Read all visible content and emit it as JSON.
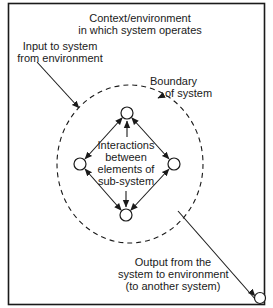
{
  "diagram": {
    "type": "system-context-diagram",
    "labels": {
      "context_line1": "Context/environment",
      "context_line2": "in which system operates",
      "input_line1": "Input to system",
      "input_line2": "from environment",
      "boundary_line1": "Boundary",
      "boundary_line2": "of system",
      "interactions_line1": "Interactions",
      "interactions_line2": "between",
      "interactions_line3": "elements of",
      "interactions_line4": "sub-system",
      "output_line1": "Output from the",
      "output_line2": "system to environment",
      "output_line3": "(to another system)"
    },
    "nodes": [
      {
        "id": "top",
        "role": "sub-system element"
      },
      {
        "id": "left",
        "role": "sub-system element"
      },
      {
        "id": "right",
        "role": "sub-system element"
      },
      {
        "id": "bottom",
        "role": "sub-system element"
      },
      {
        "id": "external",
        "role": "another system"
      }
    ],
    "edges": [
      {
        "from": "top",
        "to": "left",
        "type": "bidirectional"
      },
      {
        "from": "top",
        "to": "right",
        "type": "bidirectional"
      },
      {
        "from": "bottom",
        "to": "left",
        "type": "bidirectional"
      },
      {
        "from": "bottom",
        "to": "right",
        "type": "bidirectional"
      },
      {
        "from": "interactions-label",
        "to": "top",
        "type": "arrow"
      },
      {
        "from": "interactions-label",
        "to": "bottom",
        "type": "arrow"
      },
      {
        "from": "environment",
        "to": "system-boundary",
        "type": "input-arrow"
      },
      {
        "from": "system-boundary",
        "to": "external",
        "type": "output-arrow"
      }
    ],
    "colors": {
      "stroke": "#1a1a1a",
      "background": "#ffffff"
    }
  }
}
